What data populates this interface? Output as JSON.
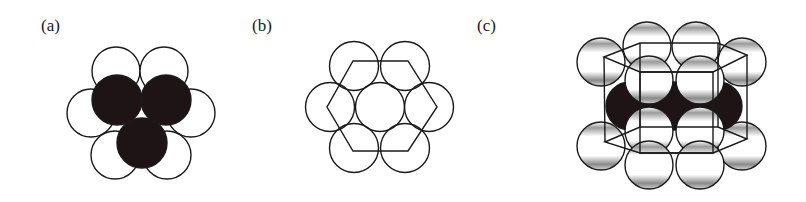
{
  "panels": [
    {
      "id": "a",
      "label": "(a)",
      "label_pos": [
        41,
        17
      ]
    },
    {
      "id": "b",
      "label": "(b)",
      "label_pos": [
        252,
        17
      ]
    },
    {
      "id": "c",
      "label": "(c)",
      "label_pos": [
        477,
        17
      ]
    }
  ],
  "colors": {
    "stroke": "#1a1a1a",
    "dark": "#1e1416",
    "fill": "#ffffff"
  },
  "panel_a": {
    "radius": 24,
    "white_spheres": [
      [
        116,
        71
      ],
      [
        164,
        71
      ],
      [
        91,
        113
      ],
      [
        191,
        113
      ],
      [
        115,
        155
      ],
      [
        167,
        155
      ]
    ],
    "dark_spheres": [
      [
        117,
        100
      ],
      [
        166,
        100
      ],
      [
        142,
        143
      ]
    ]
  },
  "panel_b": {
    "radius": 24.5,
    "spheres": [
      [
        354,
        66
      ],
      [
        405,
        66
      ],
      [
        330,
        107
      ],
      [
        380,
        107
      ],
      [
        429,
        107
      ],
      [
        354,
        148
      ],
      [
        405,
        148
      ]
    ],
    "hexagon": [
      [
        353,
        61
      ],
      [
        408,
        61
      ],
      [
        437,
        107
      ],
      [
        408,
        151
      ],
      [
        353,
        151
      ],
      [
        327,
        107
      ]
    ]
  },
  "panel_c": {
    "radius": 24,
    "back_spheres": [
      [
        601,
        62
      ],
      [
        647,
        46
      ],
      [
        696,
        46
      ],
      [
        742,
        62
      ],
      [
        601,
        146
      ],
      [
        742,
        146
      ]
    ],
    "dark_spheres": [
      [
        630,
        106
      ],
      [
        674,
        106
      ],
      [
        718,
        106
      ]
    ],
    "mid_spheres": [
      [
        649,
        131
      ],
      [
        700,
        131
      ]
    ],
    "front_top_spheres": [
      [
        649,
        80
      ],
      [
        700,
        80
      ]
    ],
    "front_bottom_spheres": [
      [
        649,
        165
      ],
      [
        700,
        165
      ]
    ],
    "top_hexagon": [
      [
        604,
        57
      ],
      [
        640,
        43
      ],
      [
        718,
        43
      ],
      [
        747,
        55
      ],
      [
        713,
        72
      ],
      [
        640,
        72
      ]
    ],
    "bottom_hexagon": [
      [
        605,
        142
      ],
      [
        640,
        127
      ],
      [
        718,
        127
      ],
      [
        747,
        139
      ],
      [
        713,
        153
      ],
      [
        640,
        153
      ]
    ],
    "front_square": [
      [
        640,
        72
      ],
      [
        713,
        72
      ],
      [
        713,
        153
      ],
      [
        640,
        153
      ]
    ]
  }
}
